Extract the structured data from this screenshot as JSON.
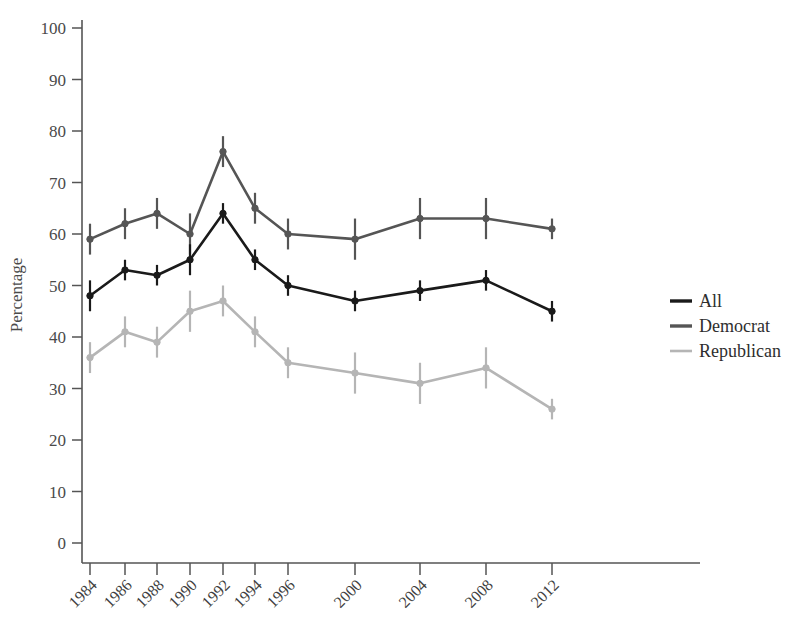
{
  "chart_data": {
    "type": "line",
    "title": "",
    "xlabel": "",
    "ylabel": "Percentage",
    "ylim": [
      0,
      100
    ],
    "ytick_values": [
      0,
      10,
      20,
      30,
      40,
      50,
      60,
      70,
      80,
      90,
      100
    ],
    "ytick_labels": [
      "0",
      "10",
      "20",
      "30",
      "40",
      "50",
      "60",
      "70",
      "80",
      "90",
      "100"
    ],
    "categories": [
      "1984",
      "1986",
      "1988",
      "1990",
      "1992",
      "1994",
      "1996",
      "2000",
      "2004",
      "2008",
      "2012"
    ],
    "x": [
      1984,
      1986,
      1988,
      1990,
      1992,
      1994,
      1996,
      2000,
      2004,
      2008,
      2012
    ],
    "grid": false,
    "legend_position": "right",
    "error_bars": true,
    "series": [
      {
        "name": "All",
        "color": "#1a1a1a",
        "values": [
          48,
          53,
          52,
          55,
          64,
          55,
          50,
          47,
          49,
          51,
          45
        ],
        "err_low": [
          45,
          51,
          50,
          52,
          62,
          53,
          48,
          45,
          47,
          49,
          43
        ],
        "err_high": [
          51,
          55,
          54,
          58,
          66,
          57,
          52,
          49,
          51,
          53,
          47
        ]
      },
      {
        "name": "Democrat",
        "color": "#555555",
        "values": [
          59,
          62,
          64,
          60,
          76,
          65,
          60,
          59,
          63,
          63,
          61
        ],
        "err_low": [
          56,
          59,
          61,
          56,
          73,
          62,
          57,
          55,
          59,
          59,
          59
        ],
        "err_high": [
          62,
          65,
          67,
          64,
          79,
          68,
          63,
          63,
          67,
          67,
          63
        ]
      },
      {
        "name": "Republican",
        "color": "#b5b5b5",
        "values": [
          36,
          41,
          39,
          45,
          47,
          41,
          35,
          33,
          31,
          34,
          26
        ],
        "err_low": [
          33,
          38,
          36,
          41,
          44,
          38,
          32,
          29,
          27,
          30,
          24
        ],
        "err_high": [
          39,
          44,
          42,
          49,
          50,
          44,
          38,
          37,
          35,
          38,
          28
        ]
      }
    ]
  },
  "legend": {
    "items": [
      {
        "label": "All",
        "color": "#1a1a1a"
      },
      {
        "label": "Democrat",
        "color": "#555555"
      },
      {
        "label": "Republican",
        "color": "#b5b5b5"
      }
    ]
  },
  "axes": {
    "y_title": "Percentage"
  }
}
